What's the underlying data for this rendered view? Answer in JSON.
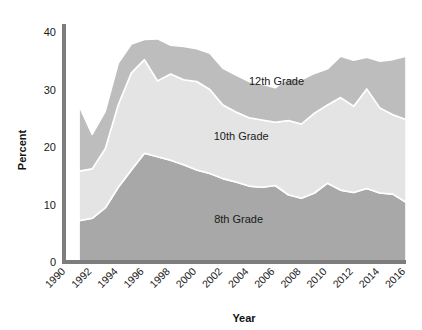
{
  "chart_data": {
    "type": "area",
    "stacked": true,
    "title": "",
    "xlabel": "Year",
    "ylabel": "Percent",
    "grid": false,
    "legend_position": "inline-annotations",
    "xlim": [
      1990,
      2016
    ],
    "ylim": [
      0,
      42
    ],
    "yticks": [
      0,
      10,
      20,
      30,
      40
    ],
    "ytick_labels": [
      "0",
      "10",
      "20",
      "30",
      "40"
    ],
    "xticks": [
      1990,
      1992,
      1994,
      1996,
      1998,
      2000,
      2002,
      2004,
      2006,
      2008,
      2010,
      2012,
      2014,
      2016
    ],
    "xtick_labels": [
      "1990",
      "1992",
      "1994",
      "1996",
      "1998",
      "2000",
      "2002",
      "2004",
      "2006",
      "2008",
      "2010",
      "2012",
      "2014",
      "2016"
    ],
    "x": [
      1991,
      1992,
      1993,
      1994,
      1995,
      1996,
      1997,
      1998,
      1999,
      2000,
      2001,
      2002,
      2003,
      2004,
      2005,
      2006,
      2007,
      2008,
      2009,
      2010,
      2011,
      2012,
      2013,
      2014,
      2015,
      2016
    ],
    "series": [
      {
        "name": "8th Grade",
        "color": "#a8a8a8",
        "label": "8th Grade",
        "values": [
          7.2,
          7.6,
          9.4,
          13.0,
          16.0,
          18.9,
          18.3,
          17.7,
          16.9,
          16.0,
          15.4,
          14.5,
          13.9,
          13.2,
          13.0,
          13.3,
          11.7,
          11.1,
          12.0,
          13.7,
          12.5,
          12.1,
          12.8,
          12.0,
          11.8,
          10.4
        ],
        "units": "percent"
      },
      {
        "name": "10th Grade",
        "color": "#e4e4e4",
        "label": "10th Grade",
        "values": [
          8.6,
          8.6,
          10.3,
          14.4,
          16.9,
          16.3,
          13.2,
          15.0,
          14.8,
          15.4,
          14.6,
          12.8,
          12.2,
          11.9,
          11.7,
          11.0,
          12.9,
          12.9,
          13.9,
          13.6,
          16.1,
          15.0,
          17.3,
          14.8,
          13.8,
          14.4
        ],
        "units": "percent"
      },
      {
        "name": "12th Grade",
        "color": "#bdbdbd",
        "label": "12th Grade",
        "values": [
          11.4,
          6.0,
          6.5,
          7.2,
          5.0,
          3.5,
          7.3,
          5.0,
          5.8,
          5.7,
          6.3,
          6.4,
          6.4,
          6.3,
          6.2,
          6.0,
          7.4,
          7.7,
          6.9,
          6.3,
          7.2,
          8.0,
          5.5,
          8.1,
          9.6,
          11.0
        ],
        "units": "percent"
      }
    ],
    "annotations": [
      {
        "name": "12th-grade-label",
        "text": "12th Grade",
        "x": 2006.1,
        "y": 30.8
      },
      {
        "name": "10th-grade-label",
        "text": "10th Grade",
        "x": 2003.4,
        "y": 21.2
      },
      {
        "name": "8th-grade-label",
        "text": "8th Grade",
        "x": 2003.2,
        "y": 6.8
      }
    ]
  },
  "axes": {
    "y_title": "Percent",
    "x_title": "Year"
  },
  "colors": {
    "axis": "#7d7d7d",
    "band_8th": "#a8a8a8",
    "band_10th": "#e4e4e4",
    "band_12th": "#bdbdbd",
    "band_edge": "#ffffff",
    "text": "#1a1a1a",
    "background": "#ffffff"
  }
}
